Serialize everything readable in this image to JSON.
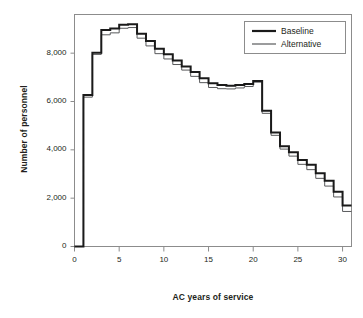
{
  "figure": {
    "title_partial": "",
    "background": "#ffffff",
    "frame_color": "#8c8c8c"
  },
  "chart_data": {
    "type": "line",
    "subtype": "step",
    "title": "",
    "xlabel": "AC years of service",
    "ylabel": "Number of personnel",
    "xlim": [
      0,
      31
    ],
    "ylim": [
      0,
      9600
    ],
    "grid": false,
    "legend_position": "top-right",
    "x_ticks": [
      0,
      5,
      10,
      15,
      20,
      25,
      30
    ],
    "x_tick_labels": [
      "0",
      "5",
      "10",
      "15",
      "20",
      "25",
      "30"
    ],
    "y_ticks": [
      0,
      2000,
      4000,
      6000,
      8000
    ],
    "y_tick_labels": [
      "0",
      "2,000",
      "4,000",
      "6,000",
      "8,000"
    ],
    "x": [
      0,
      1,
      2,
      3,
      4,
      5,
      6,
      7,
      8,
      9,
      10,
      11,
      12,
      13,
      14,
      15,
      16,
      17,
      18,
      19,
      20,
      21,
      22,
      23,
      24,
      25,
      26,
      27,
      28,
      29,
      30
    ],
    "series": [
      {
        "name": "Baseline",
        "color": "#1a1a1a",
        "width": 2.0,
        "values": [
          0,
          6270,
          8020,
          8960,
          9020,
          9180,
          9200,
          8800,
          8500,
          8180,
          7960,
          7700,
          7450,
          7220,
          6960,
          6760,
          6680,
          6650,
          6680,
          6720,
          6850,
          5620,
          4720,
          4150,
          3900,
          3580,
          3380,
          3030,
          2720,
          2270,
          1700
        ]
      },
      {
        "name": "Alternative",
        "color": "#58595b",
        "width": 1.0,
        "values": [
          0,
          6180,
          7950,
          8760,
          8840,
          9030,
          9060,
          8620,
          8300,
          7980,
          7760,
          7530,
          7300,
          7040,
          6780,
          6580,
          6530,
          6520,
          6560,
          6620,
          6800,
          5510,
          4600,
          4030,
          3740,
          3400,
          3180,
          2820,
          2500,
          2050,
          1450
        ]
      }
    ]
  },
  "legend": {
    "entries": [
      {
        "label": "Baseline"
      },
      {
        "label": "Alternative"
      }
    ]
  }
}
